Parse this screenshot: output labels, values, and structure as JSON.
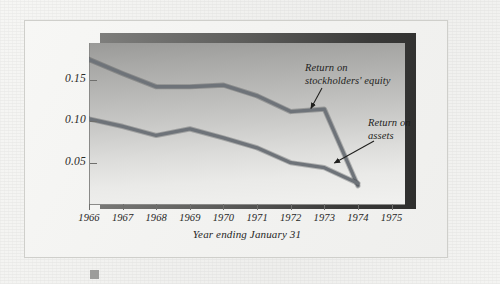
{
  "figure": {
    "footer_marker": "square-marker"
  },
  "chart_data": {
    "type": "line",
    "title": "",
    "subtitle": "",
    "xlabel": "Year ending January 31",
    "ylabel": "",
    "x": [
      1966,
      1967,
      1968,
      1969,
      1970,
      1971,
      1972,
      1973,
      1974
    ],
    "xtick_labels": [
      "1966",
      "1967",
      "1968",
      "1969",
      "1970",
      "1971",
      "1972",
      "1973",
      "1974",
      "1975"
    ],
    "xlim": [
      1966,
      1975.4
    ],
    "ytick_labels": [
      "0.05",
      "0.10",
      "0.15"
    ],
    "yticks": [
      0.05,
      0.1,
      0.15
    ],
    "ylim": [
      0.0,
      0.195
    ],
    "grid": false,
    "legend": "annotations",
    "series": [
      {
        "name": "Return on stockholders' equity",
        "color": "#6e7379",
        "values": [
          0.175,
          0.158,
          0.142,
          0.142,
          0.144,
          0.131,
          0.112,
          0.115,
          0.022
        ]
      },
      {
        "name": "Return on assets",
        "color": "#6e7379",
        "values": [
          0.103,
          0.094,
          0.083,
          0.091,
          0.08,
          0.068,
          0.05,
          0.044,
          0.025
        ]
      }
    ],
    "annotations": [
      {
        "name": "equity-annotation",
        "text": "Return on\nstockholders' equity",
        "points_to_year": 1972.6,
        "points_to_value": 0.112
      },
      {
        "name": "assets-annotation",
        "text": "Return on\nassets",
        "points_to_year": 1973.3,
        "points_to_value": 0.046
      }
    ]
  }
}
